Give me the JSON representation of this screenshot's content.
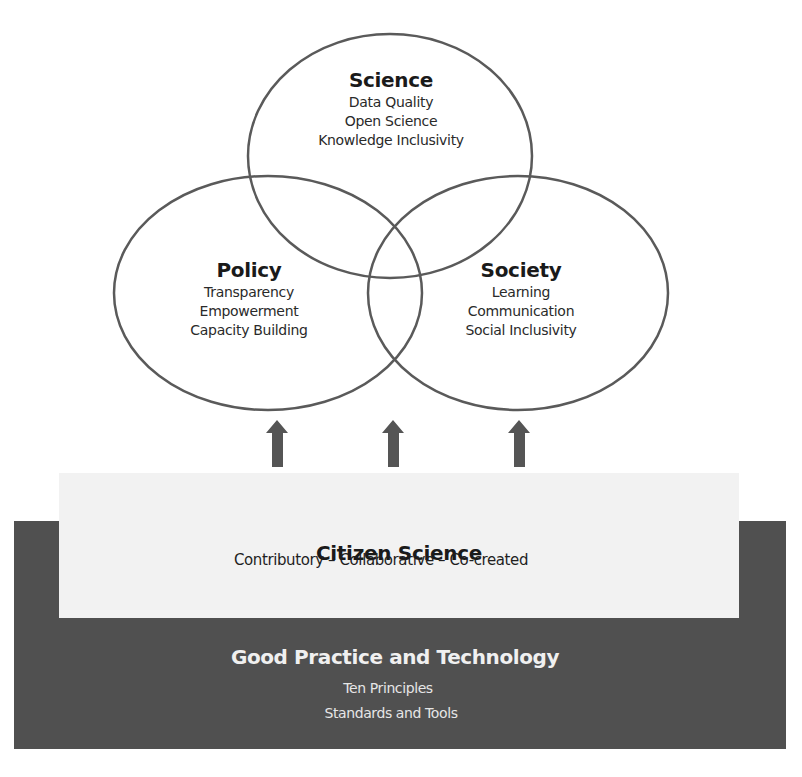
{
  "diagram": {
    "circles": [
      {
        "id": "science",
        "title": "Science",
        "items": [
          "Data Quality",
          "Open Science",
          "Knowledge Inclusivity"
        ]
      },
      {
        "id": "policy",
        "title": "Policy",
        "items": [
          "Transparency",
          "Empowerment",
          "Capacity Building"
        ]
      },
      {
        "id": "society",
        "title": "Society",
        "items": [
          "Learning",
          "Communication",
          "Social Inclusivity"
        ]
      }
    ],
    "arrows_count": 3,
    "citizen_science": {
      "title": "Citizen Science",
      "subtitle": "Contributory – Collaborative – Co-created"
    },
    "foundation": {
      "title": "Good Practice and Technology",
      "items": [
        "Ten Principles",
        "Standards and Tools"
      ]
    },
    "colors": {
      "outline": "#5a5a5a",
      "arrow": "#555555",
      "citizen_box": "#f2f2f2",
      "foundation_box": "#505050",
      "foundation_text": "#f0f0f0"
    }
  }
}
